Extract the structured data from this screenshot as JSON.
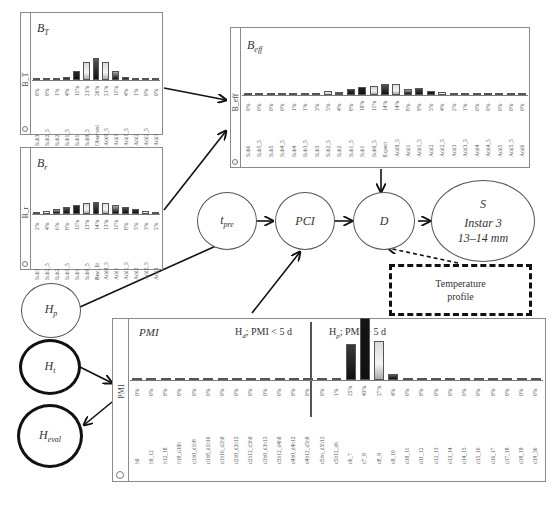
{
  "nodes": {
    "t_pre": {
      "label": "t",
      "sub": "pre"
    },
    "pci": {
      "label": "PCI"
    },
    "d": {
      "label": "D"
    },
    "s": {
      "label": "S",
      "line1": "Instar 3",
      "line2": "13–14 mm"
    },
    "h_p": {
      "label": "H",
      "sub": "p"
    },
    "h_t": {
      "label": "H",
      "sub": "t"
    },
    "h_eval": {
      "label": "H",
      "sub": "eval"
    },
    "temperature": {
      "line1": "Temperature",
      "line2": "profile"
    }
  },
  "chart_data": [
    {
      "type": "bar",
      "id": "B_T",
      "title": "B_T",
      "title_main": "B",
      "title_sub": "T",
      "ylabel": "B_T",
      "categories": [
        "Sub3",
        "Sub2_5",
        "Sub2",
        "Sub1_5",
        "Sub1",
        "Sub0_5",
        "Observed",
        "Add0_5",
        "Add1",
        "Add1_5",
        "Add2",
        "Add2_5",
        "Add3"
      ],
      "values": [
        0,
        0,
        1,
        4,
        11,
        21,
        26,
        21,
        11,
        4,
        1,
        0,
        0
      ],
      "labels": [
        "0%",
        "0%",
        "1%",
        "4%",
        "11%",
        "21%",
        "26%",
        "21%",
        "11%",
        "4%",
        "1%",
        "0%",
        "0%"
      ],
      "colors": [
        "#6a6a6a",
        "#8a8a8a",
        "#9a9a9a",
        "#5a5a5a",
        "#2a2a2a",
        "#d8d8d8",
        "#555555",
        "#dcdcdc",
        "#a8a8a8",
        "#4a4a4a",
        "#888888",
        "#bbbbbb",
        "#777777"
      ]
    },
    {
      "type": "bar",
      "id": "B_r",
      "title": "B_r",
      "title_main": "B",
      "title_sub": "r",
      "ylabel": "B_r",
      "categories": [
        "Sub3",
        "Sub2_5",
        "Sub2",
        "Sub1_5",
        "Sub1",
        "Sub0_5",
        "Best_fit",
        "Add0_5",
        "Add1",
        "Add1_5",
        "Add2",
        "Add2_5",
        "Add3"
      ],
      "values": [
        2,
        4,
        6,
        8,
        11,
        13,
        14,
        13,
        11,
        8,
        6,
        4,
        2
      ],
      "labels": [
        "2%",
        "4%",
        "6%",
        "8%",
        "11%",
        "13%",
        "14%",
        "13%",
        "11%",
        "8%",
        "5%",
        "3%",
        "2%"
      ],
      "colors": [
        "#2a2a2a",
        "#cfcfcf",
        "#9c9c9c",
        "#4f4f4f",
        "#2a2a2a",
        "#d6d6d6",
        "#555555",
        "#e0e0e0",
        "#a6a6a6",
        "#4a4a4a",
        "#2c2c2c",
        "#bdbdbd",
        "#6f6f6f"
      ]
    },
    {
      "type": "bar",
      "id": "B_eff",
      "title": "B_eff",
      "title_main": "B",
      "title_sub": "eff",
      "ylabel": "B_eff",
      "categories": [
        "Sub6",
        "Sub5_5",
        "Sub5",
        "Sub4_5",
        "Sub4",
        "Sub3_5",
        "Sub3",
        "Sub2_5",
        "Sub2",
        "Sub1_5",
        "Sub1",
        "Sub0_5",
        "Expect",
        "Add0_5",
        "Add1",
        "Add1_5",
        "Add2",
        "Add2_5",
        "Add3",
        "Add3_5",
        "Add4",
        "Add4_5",
        "Add5",
        "Add5_5",
        "Add6"
      ],
      "values": [
        0,
        0,
        0,
        0,
        1,
        1,
        3,
        5,
        4,
        8,
        10,
        11,
        14,
        14,
        8,
        9,
        5,
        4,
        2,
        1,
        0,
        0,
        0,
        0,
        0
      ],
      "labels": [
        "0%",
        "0%",
        "0%",
        "0%",
        "1%",
        "1%",
        "3%",
        "5%",
        "4%",
        "8%",
        "10%",
        "11%",
        "14%",
        "14%",
        "8%",
        "9%",
        "5%",
        "4%",
        "2%",
        "1%",
        "0%",
        "0%",
        "0%",
        "0%",
        "0%"
      ],
      "colors": [
        "#777777",
        "#999999",
        "#999999",
        "#777777",
        "#666666",
        "#bbbbbb",
        "#4a4a4a",
        "#d6d6d6",
        "#9a9a9a",
        "#3a3a3a",
        "#1e1e1e",
        "#d8d8d8",
        "#555555",
        "#dcdcdc",
        "#a8a8a8",
        "#4a4a4a",
        "#1e1e1e",
        "#c8c8c8",
        "#6a6a6a",
        "#999999",
        "#888888",
        "#999999",
        "#777777",
        "#999999",
        "#777777"
      ]
    },
    {
      "type": "bar",
      "id": "PMI",
      "title": "PMI",
      "ylabel": "PMI",
      "annotations": [
        "H_d: PMI < 5 d",
        "H_p: PMI > 5 d"
      ],
      "categories": [
        "h0",
        "h0_12",
        "h12_18",
        "h18_d10h",
        "d1h0_d1h8",
        "d1h8_d1h16",
        "d1h16_d2h0",
        "d2h0_d2h12",
        "d2h12_d3h0",
        "d3h0_d3h12",
        "d3h12_d4h0",
        "d4h0_d4h12",
        "d4h12_d5h0",
        "d5ho_d5h12",
        "d5h12_d6",
        "d6_7",
        "d7_8",
        "d8_9",
        "d9_10",
        "d10_11",
        "d11_12",
        "d12_13",
        "d13_14",
        "d14_15",
        "d15_16",
        "d16_17",
        "d17_18",
        "d18_19",
        "d19_36"
      ],
      "values": [
        0,
        0,
        0,
        0,
        0,
        0,
        0,
        0,
        0,
        0,
        0,
        0,
        0,
        0,
        1,
        25,
        43,
        27,
        4,
        0,
        0,
        0,
        0,
        0,
        0,
        0,
        0,
        0,
        0
      ],
      "labels": [
        "0%",
        "0%",
        "0%",
        "0%",
        "0%",
        "0%",
        "0%",
        "0%",
        "0%",
        "0%",
        "0%",
        "0%",
        "0%",
        "0%",
        "1%",
        "25%",
        "43%",
        "27%",
        "4%",
        "0%",
        "0%",
        "0%",
        "0%",
        "0%",
        "0%",
        "0%",
        "0%",
        "0%",
        "0%"
      ],
      "colors": [
        "#777777",
        "#777777",
        "#777777",
        "#777777",
        "#777777",
        "#777777",
        "#777777",
        "#777777",
        "#777777",
        "#777777",
        "#777777",
        "#888888",
        "#888888",
        "#888888",
        "#888888",
        "#3a3a3a",
        "#141414",
        "#dcdcdc",
        "#555555",
        "#888888",
        "#888888",
        "#888888",
        "#888888",
        "#888888",
        "#888888",
        "#888888",
        "#888888",
        "#888888",
        "#888888"
      ]
    }
  ],
  "pmi_annotations": {
    "hd_main": "H",
    "hd_sub": "d",
    "hd_rest": "; PMI < 5 d",
    "hp_main": "H",
    "hp_sub": "p",
    "hp_rest": "; PMI > 5 d"
  }
}
